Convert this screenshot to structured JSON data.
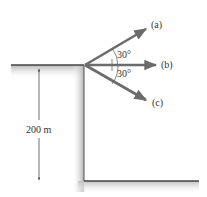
{
  "diagram": {
    "labels": {
      "a": "(a)",
      "b": "(b)",
      "c": "(c)",
      "angle_top": "30°",
      "angle_bottom": "30°",
      "height": "200 m"
    },
    "colors": {
      "arrow": "#6b6b6b",
      "ground_line": "#444444",
      "shading": "#bdbdbd",
      "text": "#333333"
    }
  }
}
